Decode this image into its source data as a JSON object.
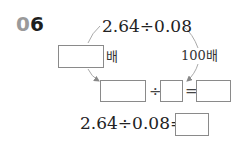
{
  "problem": {
    "number_prefix": "0",
    "number_suffix": "6",
    "top_expression": "2.64÷0.08",
    "left_multiplier_suffix": "배",
    "right_multiplier": "100배",
    "transformed_row": {
      "divide_sign": "÷",
      "equals_sign": "="
    },
    "final_expression": "2.64÷0.08="
  }
}
